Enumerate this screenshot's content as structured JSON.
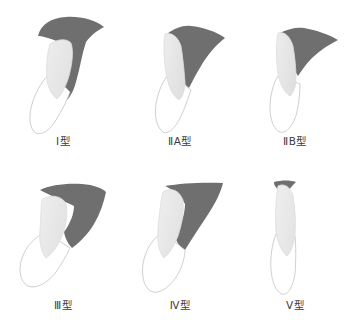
{
  "figure": {
    "background_color": "#ffffff",
    "palette": {
      "dark_region": "#6f6f6f",
      "dark_region_shade": "#5e5e5e",
      "light_region": "#e9e9e9",
      "light_region_edge": "#dcdcdc",
      "outline": "#c9c9c9",
      "label_text": "#3c3c3c"
    },
    "layout": {
      "rows": 2,
      "columns": 3,
      "width": 361,
      "height": 331
    },
    "panels": [
      {
        "id": "type-1",
        "label": "Ⅰ型",
        "roman": "Ⅰ",
        "suffix": "型",
        "row": 0,
        "column": 0,
        "has_dark_region": true,
        "dark_coverage": "large-curved-hook",
        "description": "hook-shaped dark region curving down the right side enclosing a light crown"
      },
      {
        "id": "type-2a",
        "label": "ⅡA型",
        "roman": "ⅡA",
        "suffix": "型",
        "row": 0,
        "column": 1,
        "has_dark_region": true,
        "dark_coverage": "wide-triangular-wing",
        "description": "broad triangular dark wing to the upper right of a light crown"
      },
      {
        "id": "type-2b",
        "label": "ⅡB型",
        "roman": "ⅡB",
        "suffix": "型",
        "row": 0,
        "column": 2,
        "has_dark_region": true,
        "dark_coverage": "narrow-triangular-wing",
        "description": "narrower triangular dark wing to the right of a light crown"
      },
      {
        "id": "type-3",
        "label": "Ⅲ型",
        "roman": "Ⅲ",
        "suffix": "型",
        "row": 1,
        "column": 0,
        "has_dark_region": true,
        "dark_coverage": "block-band-upper-right",
        "description": "thick dark band wrapping over the top and down the right of a light crown"
      },
      {
        "id": "type-4",
        "label": "Ⅳ型",
        "roman": "Ⅳ",
        "suffix": "型",
        "row": 1,
        "column": 1,
        "has_dark_region": true,
        "dark_coverage": "angled-band-right",
        "description": "angled dark band along the upper right running diagonally down"
      },
      {
        "id": "type-5",
        "label": "Ⅴ型",
        "roman": "Ⅴ",
        "suffix": "型",
        "row": 1,
        "column": 2,
        "has_dark_region": true,
        "dark_coverage": "small-apical-cap",
        "description": "small dark cap at the very apex of an upright light crown"
      }
    ]
  }
}
